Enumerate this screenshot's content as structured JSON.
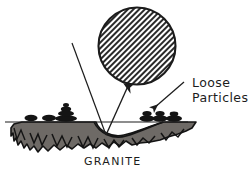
{
  "figure": {
    "title_visible": false,
    "background_color": "#ffffff",
    "ink_color": "#1c1c1c",
    "rock_fill_color": "#6e6a66",
    "hatch_color": "#2a2a2a"
  },
  "labels": {
    "loose_particles_line1": "Loose",
    "loose_particles_line2": "Particles",
    "substrate": "GRANITE"
  },
  "elements": {
    "hatched_circle": {
      "name": "hatched-circle",
      "center_x": 137,
      "center_y": 46,
      "radius": 39,
      "fill_pattern": "diagonal-hatch",
      "hatch_angle_deg": 45
    },
    "incident_ray": {
      "name": "incident-ray",
      "from_x": 72,
      "from_y": 43,
      "to_x": 106,
      "to_y": 135
    },
    "reflected_ray": {
      "name": "reflected-ray",
      "from_x": 106,
      "from_y": 135,
      "to_x": 129,
      "to_y": 84,
      "has_arrowhead": true
    },
    "surface_line": {
      "name": "surface-line",
      "x1": 5,
      "y1": 122,
      "x2": 188,
      "y2": 122
    },
    "pointer_arrow": {
      "name": "loose-particles-pointer-arrow",
      "from_x": 182,
      "from_y": 83,
      "to_x": 152,
      "to_y": 110,
      "has_arrowhead": true
    },
    "crater": {
      "name": "impact-crater",
      "description": "concave depression in granite surface at ray vertex"
    },
    "pebble_clusters": [
      {
        "name": "pebble-cluster-left",
        "x": 30,
        "y": 118
      },
      {
        "name": "pebble-cluster-left-mid",
        "x": 48,
        "y": 118
      },
      {
        "name": "pebble-cluster-stack",
        "x": 66,
        "y": 112
      },
      {
        "name": "pebble-cluster-right",
        "x": 152,
        "y": 116
      },
      {
        "name": "pebble-cluster-right-outer",
        "x": 172,
        "y": 118
      }
    ]
  }
}
